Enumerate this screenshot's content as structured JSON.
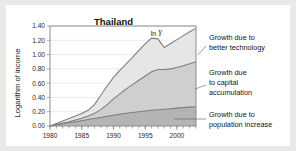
{
  "card": {
    "background": "#ffffff",
    "page_background": "#e9e9e7"
  },
  "chart_data": {
    "type": "area",
    "stacked": true,
    "title": "Thailand",
    "xlabel": "",
    "ylabel": "Logarithm of income",
    "xlim": [
      1980,
      2003
    ],
    "ylim": [
      0.0,
      1.4
    ],
    "ytick_step": 0.2,
    "grid": true,
    "legend_position": "right-annotations",
    "ytick_labels": [
      "0.00",
      "0.20",
      "0.40",
      "0.60",
      "0.80",
      "1.00",
      "1.20",
      "1.40"
    ],
    "ytick_values": [
      0.0,
      0.2,
      0.4,
      0.6,
      0.8,
      1.0,
      1.2,
      1.4
    ],
    "xtick_labels": [
      "1980",
      "1985",
      "1990",
      "1995",
      "2000"
    ],
    "xtick_values": [
      1980,
      1985,
      1990,
      1995,
      2000
    ],
    "xminor_step": 1,
    "x": [
      1980,
      1981,
      1982,
      1983,
      1984,
      1985,
      1986,
      1987,
      1988,
      1989,
      1990,
      1991,
      1992,
      1993,
      1994,
      1995,
      1996,
      1997,
      1998,
      1999,
      2000,
      2001,
      2002,
      2003
    ],
    "series": [
      {
        "name": "Growth due to population increase",
        "color": "#b4b4b4",
        "values": [
          0.0,
          0.015,
          0.03,
          0.045,
          0.06,
          0.075,
          0.09,
          0.105,
          0.12,
          0.135,
          0.15,
          0.165,
          0.178,
          0.19,
          0.2,
          0.21,
          0.22,
          0.228,
          0.235,
          0.242,
          0.25,
          0.257,
          0.264,
          0.27
        ]
      },
      {
        "name": "Growth due to capital accumulation",
        "color": "#cfcfcf",
        "values": [
          0.0,
          0.02,
          0.04,
          0.06,
          0.085,
          0.11,
          0.14,
          0.175,
          0.23,
          0.3,
          0.38,
          0.45,
          0.52,
          0.58,
          0.64,
          0.7,
          0.76,
          0.79,
          0.79,
          0.8,
          0.82,
          0.845,
          0.87,
          0.9
        ]
      },
      {
        "name": "Growth due to better technology",
        "color": "#e6e6e6",
        "values": [
          0.0,
          0.035,
          0.07,
          0.105,
          0.14,
          0.175,
          0.22,
          0.3,
          0.43,
          0.56,
          0.68,
          0.78,
          0.87,
          0.96,
          1.06,
          1.15,
          1.23,
          1.22,
          1.1,
          1.155,
          1.21,
          1.265,
          1.32,
          1.37
        ]
      }
    ],
    "series_label_in_plot": {
      "text_prefix": "ln",
      "text_italic": "Y"
    },
    "annotations": [
      {
        "id": "tech",
        "text_line1": "Growth due to",
        "text_line2": "better technology"
      },
      {
        "id": "capital",
        "text_line1": "Growth due",
        "text_line2": "to capital",
        "text_line3": "accumulation"
      },
      {
        "id": "population",
        "text_line1": "Growth due to",
        "text_line2": "population increase"
      }
    ]
  }
}
